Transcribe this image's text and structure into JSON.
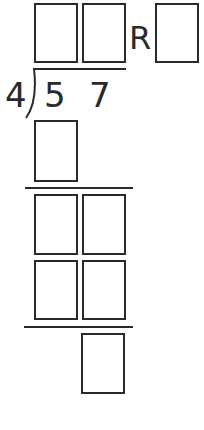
{
  "problem": {
    "divisor": "4",
    "dividend_digits": [
      "5",
      "7"
    ],
    "remainder_label": "R"
  },
  "quotient": {
    "boxes": [
      {
        "id": "quotient-tens",
        "value": ""
      },
      {
        "id": "quotient-ones",
        "value": ""
      }
    ],
    "remainder_box": {
      "id": "remainder",
      "value": ""
    }
  },
  "steps": {
    "first_product": {
      "value": ""
    },
    "first_difference": [
      {
        "value": ""
      },
      {
        "value": ""
      }
    ],
    "second_product": [
      {
        "value": ""
      },
      {
        "value": ""
      }
    ],
    "final_remainder": {
      "value": ""
    }
  },
  "colors": {
    "ink": "#2a2a2a",
    "background": "#ffffff"
  }
}
